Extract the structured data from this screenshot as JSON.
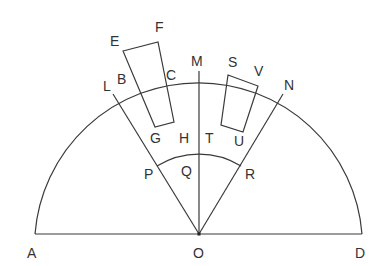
{
  "diagram": {
    "type": "semicircle-geometry",
    "colors": {
      "stroke": "#3a3a3a",
      "text": "#333333",
      "background": "#ffffff"
    },
    "center": "O",
    "diameter": [
      "A",
      "D"
    ],
    "radii": [
      "OL",
      "OM",
      "ON"
    ],
    "inner_arc": [
      "P",
      "Q",
      "R"
    ],
    "shapes": [
      {
        "name": "left-quadrilateral",
        "vertices": [
          "E",
          "F",
          "C",
          "G",
          "B"
        ]
      },
      {
        "name": "right-quadrilateral",
        "vertices": [
          "S",
          "V",
          "U",
          "T"
        ]
      }
    ],
    "labels": {
      "A": "A",
      "B": "B",
      "C": "C",
      "D": "D",
      "E": "E",
      "F": "F",
      "G": "G",
      "H": "H",
      "L": "L",
      "M": "M",
      "N": "N",
      "O": "O",
      "P": "P",
      "Q": "Q",
      "R": "R",
      "S": "S",
      "T": "T",
      "U": "U",
      "V": "V"
    }
  }
}
